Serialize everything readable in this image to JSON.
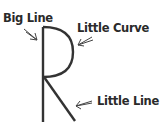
{
  "diagram": {
    "labels": [
      {
        "id": "big-line",
        "text": "Big Line"
      },
      {
        "id": "little-curve",
        "text": "Little Curve"
      },
      {
        "id": "little-line",
        "text": "Little Line"
      }
    ],
    "colors": {
      "stroke": "#333333",
      "text": "#2a2a2a",
      "background": "#ffffff"
    }
  }
}
